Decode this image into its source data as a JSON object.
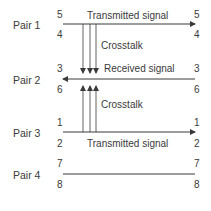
{
  "pairs": [
    {
      "label": "Pair 1",
      "top_pin": "5",
      "bottom_pin": "4",
      "signal": "Transmitted signal",
      "direction": "right"
    },
    {
      "label": "Pair 2",
      "top_pin": "3",
      "bottom_pin": "6",
      "signal": "Received signal",
      "direction": "left"
    },
    {
      "label": "Pair 3",
      "top_pin": "1",
      "bottom_pin": "2",
      "signal": "Transmitted signal",
      "direction": "right"
    },
    {
      "label": "Pair 4",
      "top_pin": "7",
      "bottom_pin": "8",
      "signal": "",
      "direction": "none"
    }
  ],
  "crosstalk": {
    "upper_label": "Crosstalk",
    "lower_label": "Crosstalk"
  },
  "colors": {
    "line": "#3a3a3a",
    "text": "#3a3a3a"
  }
}
